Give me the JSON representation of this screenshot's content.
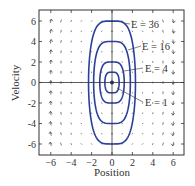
{
  "chart_data": {
    "type": "line",
    "title": "",
    "xlabel": "Position",
    "ylabel": "Velocity",
    "xlim": [
      -7,
      7
    ],
    "ylim": [
      -7,
      7
    ],
    "xticks": [
      -6,
      -4,
      -2,
      0,
      2,
      4,
      6
    ],
    "yticks": [
      -6,
      -4,
      -2,
      0,
      2,
      4,
      6
    ],
    "grid": false,
    "series": [
      {
        "name": "E = 1",
        "energy": 1,
        "x_extent": 0.7,
        "v_extent": 1
      },
      {
        "name": "E = 4",
        "energy": 4,
        "x_extent": 1.2,
        "v_extent": 2
      },
      {
        "name": "E = 16",
        "energy": 16,
        "x_extent": 1.8,
        "v_extent": 4
      },
      {
        "name": "E = 36",
        "energy": 36,
        "x_extent": 2.3,
        "v_extent": 6
      }
    ],
    "annotations": [
      "E = 36",
      "E = 16",
      "E = 4",
      "E = 1"
    ],
    "vector_field": {
      "x_values": [
        -6,
        -5,
        -4,
        -3,
        -2,
        -1,
        0,
        1,
        2,
        3,
        4,
        5,
        6
      ],
      "y_values": [
        -6,
        -5,
        -4,
        -3,
        -2,
        -1,
        0,
        1,
        2,
        3,
        4,
        5,
        6
      ],
      "direction": "up for x<0, down for x>0"
    },
    "colors": {
      "contour": "#2a3f9e",
      "axes": "#333333",
      "arrows": "#444444",
      "origin_dot": "#1a2a7a"
    }
  },
  "labels": {
    "xlabel": "Position",
    "ylabel": "Velocity",
    "e36": "E = 36",
    "e16": "E = 16",
    "e4": "E = 4",
    "e1": "E = 1"
  }
}
